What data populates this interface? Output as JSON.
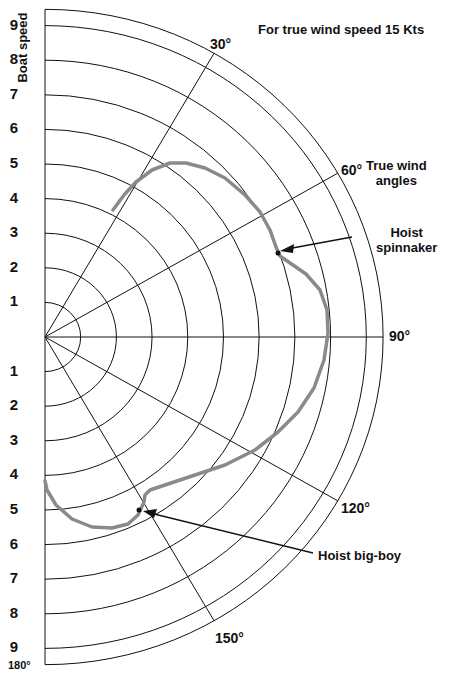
{
  "chart_data": {
    "type": "polar-line",
    "title": "For true wind speed 15 Kts",
    "ylabel": "Boat speed",
    "angle_axis_label": "True wind angles",
    "radial_ticks_upper": [
      "9",
      "8",
      "7",
      "6",
      "5",
      "4",
      "3",
      "2",
      "1"
    ],
    "radial_ticks_lower": [
      "1",
      "2",
      "3",
      "4",
      "5",
      "6",
      "7",
      "8",
      "9"
    ],
    "radial_range": [
      0,
      9.5
    ],
    "angle_ticks": [
      "30°",
      "60°",
      "90°",
      "120°",
      "150°",
      "180°"
    ],
    "angle_range_deg": [
      0,
      180
    ],
    "grid": true,
    "series": [
      {
        "name": "Polar curve (boat speed vs true wind angle)",
        "color": "#8a8a8a",
        "points_deg_kts": [
          [
            42,
            3.7
          ],
          [
            35,
            4.4
          ],
          [
            27,
            5.0
          ],
          [
            20,
            5.2
          ],
          [
            10,
            5.0
          ],
          [
            8,
            5.0
          ],
          [
            0,
            5.0
          ]
        ],
        "curve_points": [
          {
            "twa": 42,
            "bs": 3.7
          },
          {
            "twa": 36,
            "bs": 4.4
          },
          {
            "twa": 30,
            "bs": 5.0
          },
          {
            "twa": 40,
            "bs": 5.1
          },
          {
            "twa": 50,
            "bs": 5.6
          },
          {
            "twa": 58,
            "bs": 6.3
          },
          {
            "twa": 62,
            "bs": 6.8
          },
          {
            "twa": 68,
            "bs": 7.4
          },
          {
            "twa": 78,
            "bs": 7.9
          },
          {
            "twa": 90,
            "bs": 8.0
          },
          {
            "twa": 100,
            "bs": 7.9
          },
          {
            "twa": 110,
            "bs": 7.6
          },
          {
            "twa": 120,
            "bs": 7.0
          },
          {
            "twa": 130,
            "bs": 6.1
          },
          {
            "twa": 140,
            "bs": 5.2
          },
          {
            "twa": 148,
            "bs": 5.0
          },
          {
            "twa": 152,
            "bs": 5.1
          },
          {
            "twa": 160,
            "bs": 5.5
          },
          {
            "twa": 170,
            "bs": 5.0
          },
          {
            "twa": 180,
            "bs": 4.2
          }
        ]
      }
    ],
    "annotations": [
      {
        "text": "Hoist spinnaker",
        "twa": 62,
        "bs": 6.7
      },
      {
        "text": "Hoist big-boy",
        "twa": 150,
        "bs": 5.1
      }
    ]
  },
  "labels": {
    "title": "For true wind speed 15 Kts",
    "ylabel": "Boat speed",
    "twa_line1": "True wind",
    "twa_line2": "angles",
    "spin_line1": "Hoist",
    "spin_line2": "spinnaker",
    "bigboy": "Hoist big-boy",
    "a30": "30°",
    "a60": "60°",
    "a90": "90°",
    "a120": "120°",
    "a150": "150°",
    "a180": "180°"
  },
  "colors": {
    "grid": "#111111",
    "curve": "#8a8a8a"
  }
}
